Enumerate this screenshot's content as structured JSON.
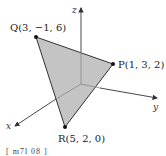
{
  "diagram": {
    "axes": {
      "x": {
        "label": "x"
      },
      "y": {
        "label": "y"
      },
      "z": {
        "label": "z"
      }
    },
    "points": [
      {
        "name": "Q",
        "label": "Q(3, −1, 6)",
        "coords": [
          3,
          -1,
          6
        ]
      },
      {
        "name": "P",
        "label": "P(1, 3, 2)",
        "coords": [
          1,
          3,
          2
        ]
      },
      {
        "name": "R",
        "label": "R(5, 2, 0)",
        "coords": [
          5,
          2,
          0
        ]
      }
    ],
    "colors": {
      "triangle_fill": "#c4c4c4",
      "edge": "#333333",
      "axis": "#444444"
    },
    "caption": "[ m7l 08 ]"
  }
}
